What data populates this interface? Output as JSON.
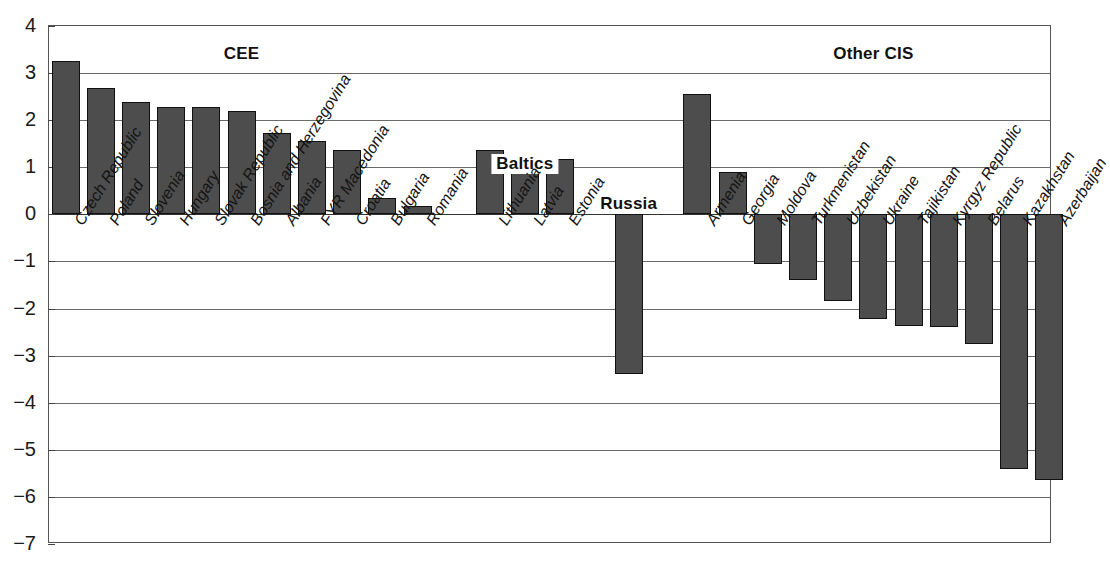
{
  "chart_data": {
    "type": "bar",
    "title": "",
    "xlabel": "",
    "ylabel": "",
    "ylim": [
      -7,
      4
    ],
    "y_ticks": [
      4,
      3,
      2,
      1,
      0,
      -1,
      -2,
      -3,
      -4,
      -5,
      -6,
      -7
    ],
    "y_tick_labels": [
      "4",
      "3",
      "2",
      "1",
      "0",
      "−1",
      "−2",
      "−3",
      "−4",
      "−5",
      "−6",
      "−7"
    ],
    "grid": true,
    "legend": "none",
    "bar_color": "#4d4d4d",
    "bar_edge_color": "#111111",
    "groups": [
      {
        "name": "CEE",
        "start_index": 0,
        "end_index": 10
      },
      {
        "name": "Baltics",
        "start_index": 11,
        "end_index": 13
      },
      {
        "name": "Russia",
        "start_index": 14,
        "end_index": 14
      },
      {
        "name": "Other CIS",
        "start_index": 15,
        "end_index": 25
      }
    ],
    "categories": [
      "Czech Republic",
      "Poland",
      "Slovenia",
      "Hungary",
      "Slovak Republic",
      "Bosnia and Herzegovina",
      "Albania",
      "FYR Macedonia",
      "Croatia",
      "Bulgaria",
      "Romania",
      "Lithuania",
      "Latvia",
      "Estonia",
      "Russia",
      "Armenia",
      "Georgia",
      "Moldova",
      "Turkmenistan",
      "Uzbekistan",
      "Ukraine",
      "Tajikistan",
      "Kyrgyz Republic",
      "Belarus",
      "Kazakhstan",
      "Azerbaijan"
    ],
    "axis_tick_labels": [
      "Czech Republic",
      "Poland",
      "Slovenia",
      "Hungary",
      "Slovak Republic",
      "Bosnia and Herzegovina",
      "Albania",
      "FYR Macedonia",
      "Croatia",
      "Bulgaria",
      "Romania",
      "Lithuania",
      "Latvia",
      "Estonia",
      "Armenia",
      "Georgia",
      "Moldova",
      "Turkmenistan",
      "Uzbekistan",
      "Ukraine",
      "Tajikistan",
      "Kyrgyz Republic",
      "Belarus",
      "Kazakhstan",
      "Azerbaijan"
    ],
    "values": [
      3.25,
      2.68,
      2.38,
      2.27,
      2.27,
      2.19,
      1.72,
      1.56,
      1.37,
      0.35,
      0.17,
      1.37,
      1.15,
      1.17,
      -3.38,
      2.55,
      0.9,
      -1.05,
      -1.4,
      -1.83,
      -2.22,
      -2.38,
      -2.4,
      -2.75,
      -5.4,
      -5.65
    ]
  }
}
